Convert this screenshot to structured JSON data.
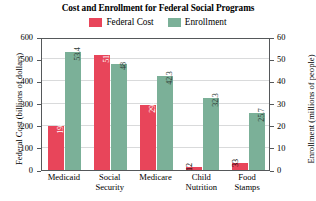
{
  "chart_data": {
    "type": "bar",
    "title": "Cost and Enrollment for Federal Social Programs",
    "categories": [
      "Medicaid",
      "Social\nSecurity",
      "Medicare",
      "Child\nNutrition",
      "Food\nStamps"
    ],
    "series": [
      {
        "name": "Federal Cost",
        "color": "#e8455a",
        "axis": "left",
        "values": [
          198,
          519,
          294,
          12,
          33
        ],
        "labels": [
          "198",
          "519",
          "294",
          "12",
          "33"
        ]
      },
      {
        "name": "Enrollment",
        "color": "#7bb098",
        "axis": "right",
        "values": [
          53.4,
          48,
          42.3,
          32.3,
          25.7
        ],
        "labels": [
          "53.4",
          "48",
          "42.3",
          "32.3",
          "25.7"
        ]
      }
    ],
    "xlabel": "",
    "ylabel": "Federal Cost (billions of dollars)",
    "ylabel_right": "Enrollment (millions of people)",
    "ylim": [
      0,
      600
    ],
    "ylim_right": [
      0,
      60
    ],
    "yticks": [
      "0",
      "100",
      "200",
      "300",
      "400",
      "500",
      "600"
    ],
    "yticks_right": [
      "0",
      "10",
      "20",
      "30",
      "40",
      "50",
      "60"
    ],
    "grid": true,
    "legend_position": "top-center"
  },
  "legend": {
    "entries": [
      {
        "label": "Federal Cost",
        "color": "#e8455a"
      },
      {
        "label": "Enrollment",
        "color": "#7bb098"
      }
    ]
  }
}
